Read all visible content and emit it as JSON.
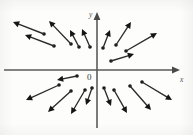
{
  "figure": {
    "caption_title": "Radial direction field",
    "background_color": "#fdfdfc",
    "arrow_color": "#151515",
    "axis_color": "#5a5a58"
  },
  "axes": {
    "origin": {
      "x": 97,
      "y": 70,
      "label": "0"
    },
    "x_axis": {
      "label": "x",
      "label_x": 180,
      "label_y": 82,
      "start_x": 4,
      "end_x": 180,
      "y": 70
    },
    "y_axis": {
      "label": "y",
      "label_x": 89,
      "label_y": 17,
      "start_y": 128,
      "end_y": 12,
      "x": 97
    }
  },
  "chart_data": {
    "type": "scatter",
    "xlabel": "x",
    "ylabel": "y",
    "origin_label": "0",
    "field_rule": "vectors point radially outward from the origin",
    "vectors": [
      {
        "id": "q2-far-upper",
        "x1": 44,
        "y1": 34,
        "x2": 13,
        "y2": 22
      },
      {
        "id": "q2-mid-upper",
        "x1": 54,
        "y1": 46,
        "x2": 25,
        "y2": 35
      },
      {
        "id": "q2-inner-upper",
        "x1": 71,
        "y1": 44,
        "x2": 49,
        "y2": 21
      },
      {
        "id": "q2-near-axis-upper",
        "x1": 79,
        "y1": 47,
        "x2": 70,
        "y2": 30
      },
      {
        "id": "q2-adjacent-yaxis",
        "x1": 90,
        "y1": 47,
        "x2": 82,
        "y2": 29
      },
      {
        "id": "q1-near-yaxis-upper",
        "x1": 103,
        "y1": 48,
        "x2": 110,
        "y2": 30
      },
      {
        "id": "q1-inner-upper",
        "x1": 116,
        "y1": 45,
        "x2": 131,
        "y2": 22
      },
      {
        "id": "q1-mid-upper",
        "x1": 126,
        "y1": 51,
        "x2": 157,
        "y2": 33
      },
      {
        "id": "q1-low-angle",
        "x1": 111,
        "y1": 61,
        "x2": 134,
        "y2": 54
      },
      {
        "id": "q3-near-origin",
        "x1": 77,
        "y1": 76,
        "x2": 57,
        "y2": 80
      },
      {
        "id": "q3-mid",
        "x1": 59,
        "y1": 85,
        "x2": 26,
        "y2": 100
      },
      {
        "id": "q3-far",
        "x1": 71,
        "y1": 91,
        "x2": 48,
        "y2": 112
      },
      {
        "id": "q3-steep",
        "x1": 85,
        "y1": 90,
        "x2": 71,
        "y2": 114
      },
      {
        "id": "q3-near-yaxis",
        "x1": 92,
        "y1": 88,
        "x2": 86,
        "y2": 105
      },
      {
        "id": "q4-near-yaxis",
        "x1": 104,
        "y1": 88,
        "x2": 111,
        "y2": 106
      },
      {
        "id": "q4-steep",
        "x1": 114,
        "y1": 90,
        "x2": 127,
        "y2": 113
      },
      {
        "id": "q4-mid",
        "x1": 130,
        "y1": 86,
        "x2": 151,
        "y2": 110
      },
      {
        "id": "q4-far",
        "x1": 142,
        "y1": 82,
        "x2": 172,
        "y2": 100
      }
    ]
  }
}
